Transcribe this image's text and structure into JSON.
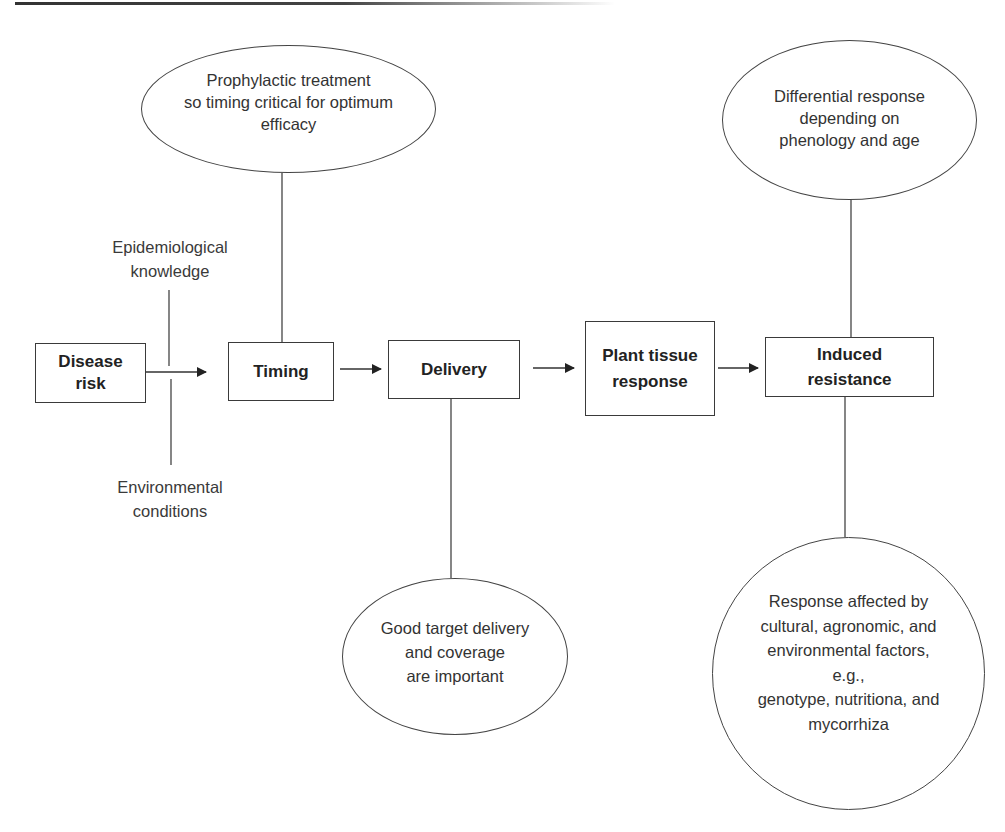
{
  "diagram": {
    "type": "flowchart",
    "nodes": {
      "disease_risk": "Disease\nrisk",
      "timing": "Timing",
      "delivery": "Delivery",
      "plant_tissue_response": "Plant tissue\nresponse",
      "induced_resistance": "Induced\nresistance"
    },
    "notes": {
      "timing_note": "Prophylactic treatment\nso timing critical for optimum\nefficacy",
      "delivery_note": "Good target delivery\nand coverage\nare important",
      "resistance_top_note": "Differential response\ndepending on\nphenology and age",
      "resistance_bottom_note": "Response affected by\ncultural, agronomic, and\nenvironmental factors,\ne.g.,\ngenotype, nutritiona, and\nmycorrhiza"
    },
    "side_labels": {
      "epidemiological": "Epidemiological\nknowledge",
      "environmental": "Environmental\nconditions"
    },
    "edges": [
      {
        "from": "Disease risk",
        "to": "Timing"
      },
      {
        "from": "Timing",
        "to": "Delivery"
      },
      {
        "from": "Delivery",
        "to": "Plant tissue response"
      },
      {
        "from": "Plant tissue response",
        "to": "Induced resistance"
      }
    ],
    "colors": {
      "stroke": "#3a3a3a",
      "text": "#2b2b2b",
      "background": "#ffffff"
    }
  }
}
